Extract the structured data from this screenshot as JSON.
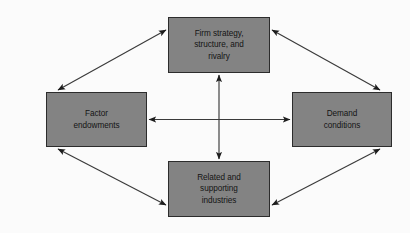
{
  "diagram": {
    "type": "diamond-framework",
    "background_color": "#fbfbfb",
    "node_fill_color": "#838383",
    "node_border_color": "#2c2c2c",
    "node_text_color": "#141414",
    "connector_color": "#333333",
    "nodes": [
      {
        "id": "firm-strategy",
        "label": "Firm strategy,\nstructure, and\nrivalry",
        "position": "top"
      },
      {
        "id": "factor-endowments",
        "label": "Factor\nendowments",
        "position": "left"
      },
      {
        "id": "demand-conditions",
        "label": "Demand\nconditions",
        "position": "right"
      },
      {
        "id": "related-supporting",
        "label": "Related and\nsupporting\nindustries",
        "position": "bottom"
      }
    ],
    "connectors": [
      {
        "id": "firm-strategy-to-factor-endowments",
        "from": "firm-strategy",
        "to": "factor-endowments",
        "style": "double-headed-diagonal"
      },
      {
        "id": "firm-strategy-to-demand-conditions",
        "from": "firm-strategy",
        "to": "demand-conditions",
        "style": "double-headed-diagonal"
      },
      {
        "id": "factor-endowments-to-related-supporting",
        "from": "factor-endowments",
        "to": "related-supporting",
        "style": "double-headed-diagonal"
      },
      {
        "id": "demand-conditions-to-related-supporting",
        "from": "demand-conditions",
        "to": "related-supporting",
        "style": "double-headed-diagonal"
      },
      {
        "id": "factor-endowments-to-demand-conditions",
        "from": "factor-endowments",
        "to": "demand-conditions",
        "style": "double-headed-horizontal"
      },
      {
        "id": "firm-strategy-to-related-supporting",
        "from": "firm-strategy",
        "to": "related-supporting",
        "style": "double-headed-vertical"
      }
    ]
  }
}
